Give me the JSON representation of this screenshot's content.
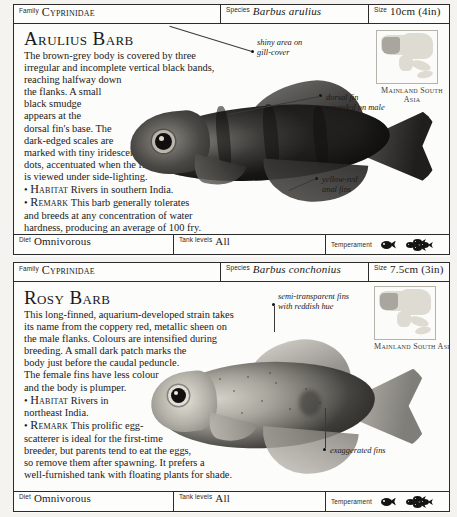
{
  "entries": [
    {
      "header": {
        "family_label": "Family",
        "family_value": "Cyprinidae",
        "species_label": "Species",
        "species_value": "Barbus arulius",
        "size_label": "Size",
        "size_value": "10cm (4in)"
      },
      "title": "Arulius Barb",
      "description": "The brown-grey body is covered by three irregular and incomplete vertical black bands, reaching halfway down the flanks. A small black smudge appears at the dorsal fin's base. The dark-edged scales are marked with tiny iridescent dots, accentuated when the fish is viewed under side-lighting.",
      "para_lines": [
        "The brown-grey body is covered by three",
        "irregular and incomplete vertical black bands,",
        "reaching halfway down",
        "the flanks. A small",
        "black smudge",
        "appears at the",
        "dorsal fin's base. The",
        "dark-edged scales are",
        "marked with tiny iridescent",
        "dots, accentuated when the fish",
        "is viewed under side-lighting."
      ],
      "habitat_keyword": "Habitat",
      "habitat_text": "Rivers in southern India.",
      "remark_keyword": "Remark",
      "remark_text": "This barb generally tolerates and breeds at any concentration of water hardness, producing an average of 100 fry.",
      "remark_lines": [
        "This barb generally tolerates",
        "and breeds at any concentration of water",
        "hardness, producing an average of 100 fry."
      ],
      "map_caption": "Mainland\nSouth Asia",
      "annotations": [
        "shiny area on\ngill-cover",
        "dorsal fin\nextended on male",
        "yellow-red\nanal fins"
      ],
      "footer": {
        "diet_label": "Diet",
        "diet_value": "Omnivorous",
        "tank_label": "Tank levels",
        "tank_value": "All",
        "temperament_label": "Temperament",
        "temperament_icons": [
          "single-fish-icon",
          "school-of-fish-icon"
        ]
      }
    },
    {
      "header": {
        "family_label": "Family",
        "family_value": "Cyprinidae",
        "species_label": "Species",
        "species_value": "Barbus conchonius",
        "size_label": "Size",
        "size_value": "7.5cm (3in)"
      },
      "title": "Rosy Barb",
      "description": "This long-finned, aquarium-developed strain takes its name from the coppery red, metallic sheen on the male flanks. Colours are intensified during breeding. A small dark patch marks the body just before the caudal peduncle. The female fins have less colour and the body is plumper.",
      "para_lines": [
        "This long-finned, aquarium-developed strain takes",
        "its name from the coppery red, metallic sheen on",
        "the male flanks. Colours are intensified during",
        "breeding. A small dark patch marks the",
        "body just before the caudal peduncle.",
        "The female fins have less colour",
        "and the body is plumper."
      ],
      "habitat_keyword": "Habitat",
      "habitat_text": "Rivers in northeast India.",
      "habitat_lines": [
        "Rivers in",
        "northeast India."
      ],
      "remark_keyword": "Remark",
      "remark_text": "This prolific egg-scatterer is ideal for the first-time breeder, but parents tend to eat the eggs, so remove them after spawning. It prefers a well-furnished tank with floating plants for shade.",
      "remark_lines": [
        "This prolific egg-",
        "scatterer is ideal for the first-time",
        "breeder, but parents tend to eat the eggs,",
        "so remove them after spawning. It prefers a",
        "well-furnished tank with floating plants for shade."
      ],
      "map_caption": "Mainland South\nAsia",
      "annotations": [
        "semi-transparent fins\nwith reddish hue",
        "exaggerated fins"
      ],
      "footer": {
        "diet_label": "Diet",
        "diet_value": "Omnivorous",
        "tank_label": "Tank levels",
        "tank_value": "All",
        "temperament_label": "Temperament",
        "temperament_icons": [
          "single-fish-icon",
          "school-of-fish-icon"
        ]
      }
    }
  ],
  "colors": {
    "page_background": "#f2f1ee",
    "card_background": "#fbfbf9",
    "rule": "#2b2b2b",
    "text": "#1a1a1a",
    "map_land": "#dedbd2",
    "map_highlight": "#a9a69d"
  }
}
